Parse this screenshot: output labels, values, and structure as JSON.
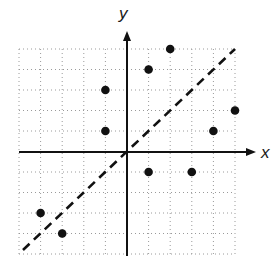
{
  "chart_data": {
    "type": "scatter",
    "title": "",
    "xlabel": "x",
    "ylabel": "y",
    "xlim": [
      -5,
      5
    ],
    "ylim": [
      -5,
      5
    ],
    "grid": true,
    "grid_style": "dotted",
    "legend": null,
    "series": [
      {
        "name": "points",
        "marker": "filled-circle",
        "color": "#111111",
        "points": [
          {
            "x": -4,
            "y": -3
          },
          {
            "x": -3,
            "y": -4
          },
          {
            "x": -1,
            "y": 1
          },
          {
            "x": -1,
            "y": 3
          },
          {
            "x": 1,
            "y": 4
          },
          {
            "x": 2,
            "y": 5
          },
          {
            "x": 1,
            "y": -1
          },
          {
            "x": 3,
            "y": -1
          },
          {
            "x": 4,
            "y": 1
          },
          {
            "x": 5,
            "y": 2
          }
        ]
      }
    ],
    "annotations": [
      {
        "type": "line",
        "style": "dashed",
        "equation": "y = x",
        "from": [
          -5,
          -5
        ],
        "to": [
          5,
          5
        ],
        "color": "#111111"
      }
    ]
  },
  "labels": {
    "x_axis": "x",
    "y_axis": "y"
  },
  "colors": {
    "axis": "#111111",
    "grid": "#9a9a9a",
    "point": "#111111",
    "line": "#111111"
  }
}
